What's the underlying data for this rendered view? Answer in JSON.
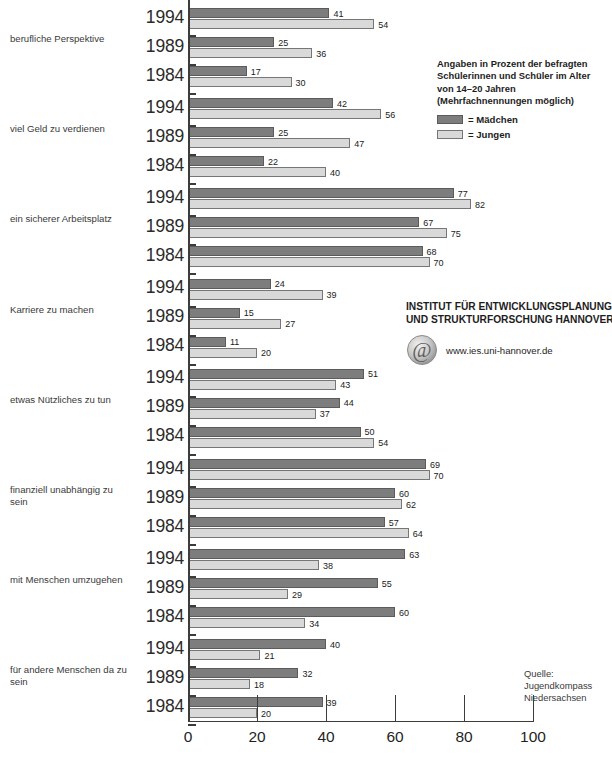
{
  "chart_data": {
    "type": "bar",
    "orientation": "horizontal",
    "title": "",
    "xlabel": "",
    "ylabel": "",
    "xlim": [
      0,
      100
    ],
    "xticks": [
      0,
      20,
      40,
      60,
      80,
      100
    ],
    "xtick_labels": [
      "0",
      "20",
      "40",
      "60",
      "80",
      "100"
    ],
    "grid": false,
    "legend_position": "top-right",
    "years": [
      "1994",
      "1989",
      "1984"
    ],
    "series": [
      {
        "name": "= Mädchen",
        "key": "girls",
        "color": "#7d7d7d"
      },
      {
        "name": "= Jungen",
        "key": "boys",
        "color": "#d9d9d9"
      }
    ],
    "categories": [
      "berufliche Perspektive",
      "viel Geld zu verdienen",
      "ein sicherer Arbeitsplatz",
      "Karriere zu machen",
      "etwas Nützliches zu tun",
      "finanziell unabhängig  zu sein",
      "mit Menschen umzugehen",
      "für andere Menschen da zu sein"
    ],
    "groups": [
      {
        "category": "berufliche Perspektive",
        "rows": [
          {
            "year": "1994",
            "girls": 41,
            "boys": 54
          },
          {
            "year": "1989",
            "girls": 25,
            "boys": 36
          },
          {
            "year": "1984",
            "girls": 17,
            "boys": 30
          }
        ]
      },
      {
        "category": "viel Geld zu verdienen",
        "rows": [
          {
            "year": "1994",
            "girls": 42,
            "boys": 56
          },
          {
            "year": "1989",
            "girls": 25,
            "boys": 47
          },
          {
            "year": "1984",
            "girls": 22,
            "boys": 40
          }
        ]
      },
      {
        "category": "ein sicherer Arbeitsplatz",
        "rows": [
          {
            "year": "1994",
            "girls": 77,
            "boys": 82
          },
          {
            "year": "1989",
            "girls": 67,
            "boys": 75
          },
          {
            "year": "1984",
            "girls": 68,
            "boys": 70
          }
        ]
      },
      {
        "category": "Karriere zu machen",
        "rows": [
          {
            "year": "1994",
            "girls": 24,
            "boys": 39
          },
          {
            "year": "1989",
            "girls": 15,
            "boys": 27
          },
          {
            "year": "1984",
            "girls": 11,
            "boys": 20
          }
        ]
      },
      {
        "category": "etwas Nützliches zu tun",
        "rows": [
          {
            "year": "1994",
            "girls": 51,
            "boys": 43
          },
          {
            "year": "1989",
            "girls": 44,
            "boys": 37
          },
          {
            "year": "1984",
            "girls": 50,
            "boys": 54
          }
        ]
      },
      {
        "category": "finanziell unabhängig  zu sein",
        "rows": [
          {
            "year": "1994",
            "girls": 69,
            "boys": 70
          },
          {
            "year": "1989",
            "girls": 60,
            "boys": 62
          },
          {
            "year": "1984",
            "girls": 57,
            "boys": 64
          }
        ]
      },
      {
        "category": "mit Menschen umzugehen",
        "rows": [
          {
            "year": "1994",
            "girls": 63,
            "boys": 38
          },
          {
            "year": "1989",
            "girls": 55,
            "boys": 29
          },
          {
            "year": "1984",
            "girls": 60,
            "boys": 34
          }
        ]
      },
      {
        "category": "für andere Menschen da zu sein",
        "rows": [
          {
            "year": "1994",
            "girls": 40,
            "boys": 21
          },
          {
            "year": "1989",
            "girls": 32,
            "boys": 18
          },
          {
            "year": "1984",
            "girls": 39,
            "boys": 20
          }
        ]
      }
    ]
  },
  "category_labels": [
    {
      "lines": [
        "berufliche Perspektive"
      ]
    },
    {
      "lines": [
        "viel Geld zu verdienen"
      ]
    },
    {
      "lines": [
        "ein sicherer Arbeitsplatz"
      ]
    },
    {
      "lines": [
        "Karriere zu machen"
      ]
    },
    {
      "lines": [
        "etwas Nützliches zu tun"
      ]
    },
    {
      "lines": [
        "finanziell unabhängig  zu",
        "sein"
      ]
    },
    {
      "lines": [
        "mit Menschen umzugehen"
      ]
    },
    {
      "lines": [
        "für andere Menschen da zu",
        "sein"
      ]
    }
  ],
  "note": {
    "lines": [
      "Angaben in Prozent der befragten",
      "Schülerinnen und Schüler im Alter",
      "von 14–20 Jahren",
      "(Mehrfachnennungen möglich)"
    ]
  },
  "legend": {
    "items": [
      {
        "label": "= Mädchen",
        "color": "#7d7d7d"
      },
      {
        "label": "= Jungen",
        "color": "#d9d9d9"
      }
    ]
  },
  "institute": {
    "lines": [
      "INSTITUT FÜR ENTWICKLUNGSPLANUNG",
      "UND STRUKTURFORSCHUNG HANNOVER"
    ],
    "url": "www.ies.uni-hannover.de",
    "logo_glyph": "@"
  },
  "source": {
    "lines": [
      "Quelle:",
      "Jugendkompass",
      "Niedersachsen"
    ]
  },
  "colors": {
    "girls": "#7d7d7d",
    "boys": "#d9d9d9",
    "axis": "#3c3c3c",
    "text": "#231f20",
    "background": "#ffffff"
  }
}
